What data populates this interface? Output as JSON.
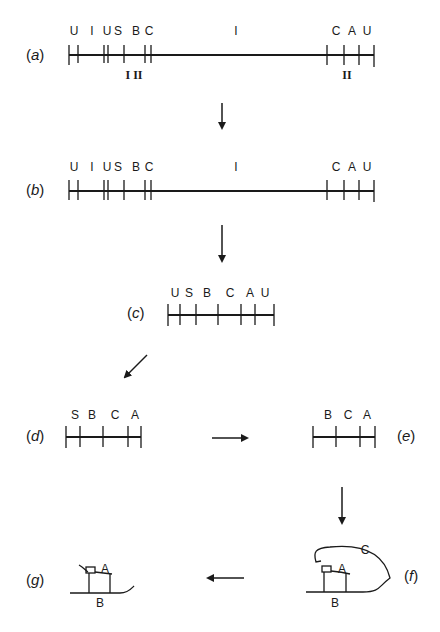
{
  "figure": {
    "panels": {
      "a": {
        "label_open": "(",
        "label_letter": "a",
        "label_close": ")",
        "sites": [
          "U",
          "I",
          "U",
          "S",
          "B",
          "C",
          "I",
          "C",
          "A",
          "U"
        ],
        "below_left": "I II",
        "below_right": "II"
      },
      "b": {
        "label_open": "(",
        "label_letter": "b",
        "label_close": ")",
        "sites": [
          "U",
          "I",
          "U",
          "S",
          "B",
          "C",
          "I",
          "C",
          "A",
          "U"
        ]
      },
      "c": {
        "label_open": "(",
        "label_letter": "c",
        "label_close": ")",
        "sites": [
          "U",
          "S",
          "B",
          "C",
          "A",
          "U"
        ]
      },
      "d": {
        "label_open": "(",
        "label_letter": "d",
        "label_close": ")",
        "sites": [
          "S",
          "B",
          "C",
          "A"
        ]
      },
      "e": {
        "label_open": "(",
        "label_letter": "e",
        "label_close": ")",
        "sites": [
          "B",
          "C",
          "A"
        ]
      },
      "f": {
        "label_open": "(",
        "label_letter": "f",
        "label_close": ")",
        "labels": [
          "C",
          "A",
          "B"
        ]
      },
      "g": {
        "label_open": "(",
        "label_letter": "g",
        "label_close": ")",
        "labels": [
          "A",
          "B"
        ]
      }
    },
    "colors": {
      "ink": "#1a1a1a",
      "background": "#ffffff"
    }
  }
}
